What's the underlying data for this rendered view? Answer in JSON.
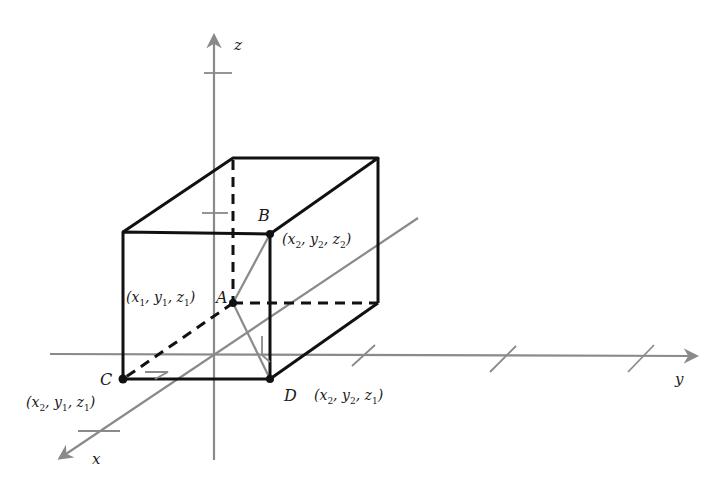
{
  "diagram": {
    "colors": {
      "box_edge": "#111111",
      "axis": "#8a8a8a",
      "diagonal": "#8a8a8a",
      "text": "#1a1a1a",
      "background": "#ffffff"
    },
    "axes": {
      "x": {
        "label": "x"
      },
      "y": {
        "label": "y"
      },
      "z": {
        "label": "z"
      }
    },
    "points": {
      "A": {
        "label": "A",
        "coords": [
          "x",
          "1",
          "y",
          "1",
          "z",
          "1"
        ]
      },
      "B": {
        "label": "B",
        "coords": [
          "x",
          "2",
          "y",
          "2",
          "z",
          "2"
        ]
      },
      "C": {
        "label": "C",
        "coords": [
          "x",
          "2",
          "y",
          "1",
          "z",
          "1"
        ]
      },
      "D": {
        "label": "D",
        "coords": [
          "x",
          "2",
          "y",
          "2",
          "z",
          "1"
        ]
      }
    },
    "segments": [
      {
        "name": "AB",
        "style": "gray-diagonal"
      },
      {
        "name": "AD",
        "style": "gray-diagonal"
      },
      {
        "name": "AC",
        "style": "dashed"
      }
    ],
    "right_angle_markers": [
      "at C",
      "at D"
    ]
  }
}
